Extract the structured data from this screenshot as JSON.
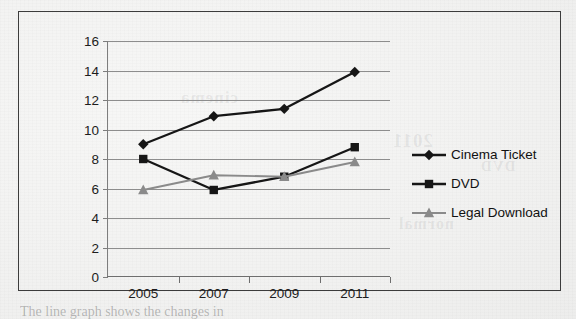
{
  "chart_data": {
    "type": "line",
    "title": "",
    "xlabel": "",
    "ylabel": "",
    "categories": [
      "2005",
      "2007",
      "2009",
      "2011"
    ],
    "ylim": [
      0,
      16
    ],
    "y_ticks": [
      0,
      2,
      4,
      6,
      8,
      10,
      12,
      14,
      16
    ],
    "grid": true,
    "legend_position": "right",
    "series": [
      {
        "name": "Cinema Ticket",
        "marker": "diamond",
        "color": "#161616",
        "values": [
          9.0,
          10.9,
          11.4,
          13.9
        ]
      },
      {
        "name": "DVD",
        "marker": "square",
        "color": "#161616",
        "values": [
          8.0,
          5.9,
          6.8,
          8.8
        ]
      },
      {
        "name": "Legal Download",
        "marker": "triangle",
        "color": "#8a8a8a",
        "values": [
          5.9,
          6.9,
          6.8,
          7.8
        ]
      }
    ]
  },
  "legend": {
    "items": [
      {
        "label": "Cinema Ticket"
      },
      {
        "label": "DVD"
      },
      {
        "label": "Legal Download"
      }
    ]
  },
  "axes": {
    "y_tick_labels": [
      "16",
      "14",
      "12",
      "10",
      "8",
      "6",
      "4",
      "2",
      "0"
    ],
    "x_tick_labels": [
      "2005",
      "2007",
      "2009",
      "2011"
    ]
  },
  "ghost_text": {
    "a": "cinema",
    "b": "2011",
    "c": "normal",
    "d": "DVD"
  },
  "caption": {
    "text": "The line graph shows the changes in"
  },
  "colors": {
    "frame": "#3c3c3c",
    "gridline": "#8d8d8d",
    "dark_series": "#161616",
    "gray_series": "#8a8a8a",
    "paper": "#f2f2f1"
  }
}
